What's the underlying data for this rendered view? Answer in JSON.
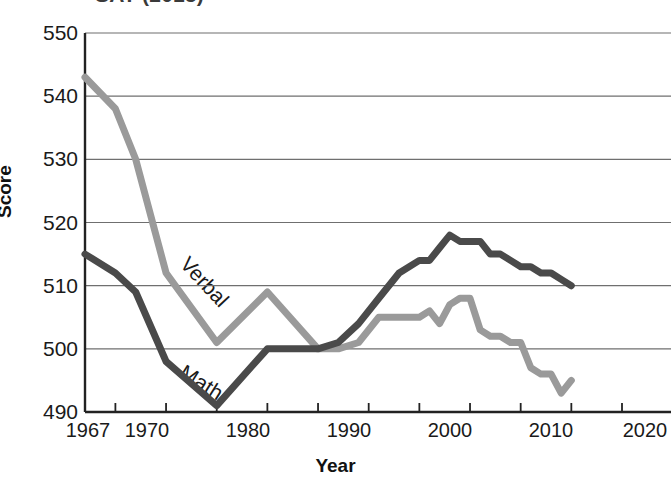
{
  "title": "SAT (2015)",
  "axes": {
    "x_label": "Year",
    "y_label": "Score",
    "x_ticks": [
      "1967",
      "1970",
      "1980",
      "1990",
      "2000",
      "2010",
      "2020"
    ],
    "y_ticks": [
      "550",
      "540",
      "530",
      "520",
      "510",
      "500",
      "490"
    ]
  },
  "series_labels": {
    "verbal": "Verbal",
    "math": "Math"
  },
  "colors": {
    "verbal": "#9a9a9a",
    "math": "#4a4a4a",
    "grid": "#6f6f6f",
    "axis": "#222222",
    "text": "#1a1a1a",
    "background": "#ffffff"
  },
  "chart_data": {
    "type": "line",
    "title": "SAT (2015)",
    "xlabel": "Year",
    "ylabel": "Score",
    "xlim": [
      1967,
      2020
    ],
    "ylim": [
      490,
      550
    ],
    "x_ticks": [
      1967,
      1970,
      1980,
      1990,
      2000,
      2010,
      2020
    ],
    "y_ticks": [
      490,
      500,
      510,
      520,
      530,
      540,
      550
    ],
    "grid": "horizontal",
    "legend": "inline-labels",
    "series": [
      {
        "name": "Verbal",
        "color": "#9a9a9a",
        "x": [
          1967,
          1970,
          1972,
          1975,
          1980,
          1985,
          1990,
          1992,
          1994,
          1996,
          1997,
          1998,
          2000,
          2001,
          2002,
          2003,
          2004,
          2005,
          2006,
          2007,
          2008,
          2009,
          2010,
          2011,
          2012,
          2013,
          2014,
          2015
        ],
        "values": [
          543,
          538,
          530,
          512,
          501,
          509,
          500,
          500,
          501,
          505,
          505,
          505,
          505,
          506,
          504,
          507,
          508,
          508,
          503,
          502,
          502,
          501,
          501,
          497,
          496,
          496,
          493,
          495
        ]
      },
      {
        "name": "Math",
        "color": "#4a4a4a",
        "x": [
          1967,
          1970,
          1972,
          1975,
          1980,
          1985,
          1990,
          1992,
          1994,
          1996,
          1998,
          2000,
          2001,
          2002,
          2003,
          2004,
          2005,
          2006,
          2007,
          2008,
          2009,
          2010,
          2011,
          2012,
          2013,
          2014,
          2015
        ],
        "values": [
          515,
          512,
          509,
          498,
          491,
          500,
          500,
          501,
          504,
          508,
          512,
          514,
          514,
          516,
          518,
          517,
          517,
          517,
          515,
          515,
          514,
          513,
          513,
          512,
          512,
          511,
          510
        ]
      }
    ]
  }
}
